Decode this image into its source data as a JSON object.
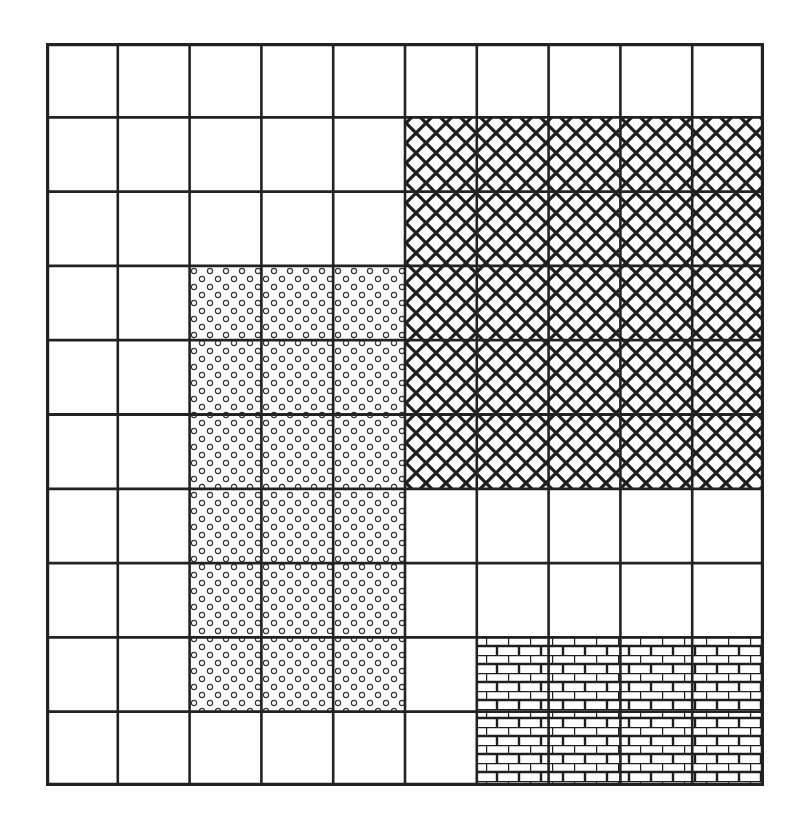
{
  "figure": {
    "type": "grid-diagram",
    "rows": 10,
    "cols": 10,
    "cell_count": 100,
    "line_color": "#222222",
    "background": "#ffffff"
  },
  "regions": [
    {
      "name": "crosshatch-region",
      "pattern": "crosshatch",
      "col_start": 5,
      "col_end": 9,
      "row_start": 1,
      "row_end": 5,
      "cells": 25
    },
    {
      "name": "circle-dot-region",
      "pattern": "circles",
      "col_start": 2,
      "col_end": 4,
      "row_start": 3,
      "row_end": 8,
      "cells": 18
    },
    {
      "name": "brick-region",
      "pattern": "brick",
      "col_start": 6,
      "col_end": 9,
      "row_start": 8,
      "row_end": 9,
      "cells": 8
    }
  ]
}
